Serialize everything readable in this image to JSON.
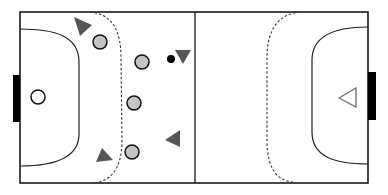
{
  "diagram": {
    "colors": {
      "line": "#1a1a1a",
      "goal": "#000000",
      "defender_fill": "#c4c4c4",
      "attacker_fill": "#555555",
      "goalkeeper_outline": "#666666",
      "ball": "#000000",
      "background": "#ffffff"
    },
    "court": {
      "x": 20,
      "y": 12,
      "width": 348,
      "height": 171,
      "midline_x": 195
    },
    "goals": [
      {
        "side": "left",
        "x": 13,
        "y": 75,
        "width": 7,
        "height": 47
      },
      {
        "side": "right",
        "x": 368,
        "y": 72,
        "width": 8,
        "height": 48
      }
    ],
    "goalkeepers": [
      {
        "team": "defense",
        "shape": "circle",
        "x": 38,
        "y": 97,
        "r": 7
      },
      {
        "team": "attack",
        "shape": "triangle-outline",
        "x": 348,
        "y": 98,
        "direction": "left"
      }
    ],
    "defenders": [
      {
        "x": 100,
        "y": 42,
        "r": 7
      },
      {
        "x": 142,
        "y": 62,
        "r": 7
      },
      {
        "x": 134,
        "y": 103,
        "r": 7
      },
      {
        "x": 132,
        "y": 152,
        "r": 7
      }
    ],
    "attackers": [
      {
        "x": 80,
        "y": 25,
        "direction": "down-right"
      },
      {
        "x": 183,
        "y": 57,
        "direction": "down"
      },
      {
        "x": 172,
        "y": 141,
        "direction": "left"
      },
      {
        "x": 103,
        "y": 156,
        "direction": "up-right"
      }
    ],
    "ball": {
      "x": 171,
      "y": 59,
      "r": 4
    }
  }
}
